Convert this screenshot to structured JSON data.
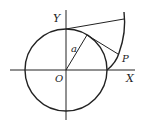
{
  "diagram": {
    "labels": {
      "y_axis": "Y",
      "x_axis": "X",
      "origin": "O",
      "radius": "a",
      "point": "P"
    },
    "colors": {
      "stroke": "#222222",
      "background": "#ffffff"
    }
  }
}
